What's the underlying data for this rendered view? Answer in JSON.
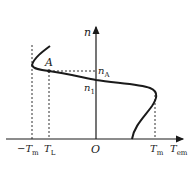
{
  "diagram": {
    "type": "motor mechanical characteristic (speed vs electromagnetic torque)",
    "axes": {
      "vertical": {
        "label": "n"
      },
      "horizontal": {
        "label_main": "T",
        "label_sub": "em"
      },
      "origin": "O"
    },
    "points": {
      "A": {
        "label": "A"
      },
      "nA": {
        "label_main": "n",
        "label_sub": "A"
      },
      "n1": {
        "label_main": "n",
        "label_sub": "1"
      }
    },
    "tick_labels": {
      "neg_Tm": {
        "label_main": "−T",
        "label_sub": "m"
      },
      "TL": {
        "label_main": "T",
        "label_sub": "L"
      },
      "Tm": {
        "label_main": "T",
        "label_sub": "m"
      }
    },
    "colors": {
      "line": "#1a1a1a",
      "background": "#ffffff"
    }
  }
}
